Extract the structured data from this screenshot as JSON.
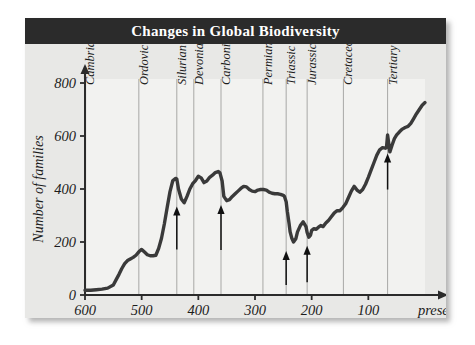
{
  "figure": {
    "title": "Changes in Global Biodiversity",
    "title_bar_color": "#2b2b2b",
    "title_text_color": "#ffffff",
    "background_color": "#e8e8e6",
    "plot_background_color": "#f2f2f0",
    "curve_color": "#3a3a3a",
    "gridline_color": "#a8a8a6"
  },
  "chart_data": {
    "type": "line",
    "title": "Changes in Global Biodiversity",
    "xlabel": "Time (in millions of years ago)",
    "ylabel": "Number of families",
    "xlim": [
      600,
      0
    ],
    "ylim": [
      0,
      800
    ],
    "x_axis_reversed": true,
    "grid": false,
    "legend": null,
    "xticks": [
      600,
      500,
      400,
      300,
      200,
      100,
      0
    ],
    "xtick_labels": [
      "600",
      "500",
      "400",
      "300",
      "200",
      "100",
      "present"
    ],
    "yticks": [
      0,
      200,
      400,
      600,
      800
    ],
    "ytick_labels": [
      "0",
      "200",
      "400",
      "600",
      "800"
    ],
    "series": [
      {
        "name": "Number of marine families",
        "x": [
          600,
          590,
          580,
          570,
          560,
          550,
          545,
          540,
          535,
          530,
          525,
          520,
          515,
          510,
          505,
          500,
          495,
          490,
          485,
          480,
          475,
          470,
          465,
          460,
          455,
          450,
          445,
          440,
          438,
          435,
          430,
          425,
          420,
          415,
          410,
          405,
          400,
          395,
          390,
          385,
          380,
          375,
          370,
          365,
          362,
          358,
          355,
          350,
          345,
          340,
          335,
          330,
          325,
          320,
          315,
          310,
          305,
          300,
          295,
          290,
          285,
          280,
          275,
          270,
          265,
          260,
          255,
          250,
          248,
          245,
          243,
          240,
          238,
          235,
          232,
          228,
          225,
          220,
          215,
          210,
          208,
          205,
          202,
          200,
          196,
          192,
          188,
          184,
          180,
          175,
          170,
          165,
          160,
          155,
          150,
          145,
          140,
          135,
          130,
          125,
          120,
          115,
          110,
          105,
          100,
          95,
          90,
          85,
          80,
          75,
          70,
          68,
          66,
          64,
          62,
          58,
          54,
          50,
          45,
          40,
          35,
          30,
          25,
          20,
          15,
          10,
          5,
          0
        ],
        "y": [
          18,
          18,
          20,
          22,
          26,
          38,
          58,
          78,
          100,
          118,
          130,
          136,
          142,
          150,
          163,
          172,
          162,
          152,
          148,
          148,
          150,
          176,
          214,
          268,
          330,
          390,
          432,
          440,
          438,
          400,
          362,
          348,
          372,
          400,
          420,
          432,
          448,
          442,
          424,
          430,
          444,
          452,
          462,
          466,
          462,
          430,
          372,
          356,
          360,
          372,
          382,
          392,
          402,
          410,
          408,
          398,
          392,
          390,
          396,
          398,
          398,
          396,
          388,
          384,
          382,
          382,
          380,
          376,
          372,
          352,
          316,
          272,
          238,
          214,
          200,
          212,
          238,
          262,
          276,
          258,
          236,
          218,
          226,
          244,
          250,
          248,
          256,
          262,
          258,
          272,
          282,
          296,
          310,
          318,
          318,
          330,
          344,
          368,
          392,
          410,
          396,
          388,
          398,
          418,
          444,
          472,
          500,
          528,
          548,
          556,
          554,
          556,
          604,
          572,
          540,
          566,
          590,
          604,
          616,
          626,
          632,
          636,
          648,
          666,
          684,
          700,
          716,
          726
        ]
      }
    ],
    "geologic_periods": [
      {
        "name": "Cambrian",
        "start": 600,
        "end": 505
      },
      {
        "name": "Ordovician",
        "start": 505,
        "end": 438
      },
      {
        "name": "Silurian",
        "start": 438,
        "end": 408
      },
      {
        "name": "Devonian",
        "start": 408,
        "end": 360
      },
      {
        "name": "Carboniferous",
        "start": 360,
        "end": 286
      },
      {
        "name": "Permian",
        "start": 286,
        "end": 245
      },
      {
        "name": "Triassic",
        "start": 245,
        "end": 208
      },
      {
        "name": "Jurassic",
        "start": 208,
        "end": 144
      },
      {
        "name": "Cretaceous",
        "start": 144,
        "end": 66
      },
      {
        "name": "Tertiary",
        "start": 66,
        "end": 0
      }
    ],
    "annotations": [
      {
        "label": "mass-extinction-marker",
        "x": 438,
        "y_top": 330,
        "y_bottom": 172
      },
      {
        "label": "mass-extinction-marker",
        "x": 360,
        "y_top": 336,
        "y_bottom": 170
      },
      {
        "label": "mass-extinction-marker",
        "x": 245,
        "y_top": 162,
        "y_bottom": 38
      },
      {
        "label": "mass-extinction-marker",
        "x": 208,
        "y_top": 182,
        "y_bottom": 48
      },
      {
        "label": "mass-extinction-marker",
        "x": 66,
        "y_top": 530,
        "y_bottom": 398
      }
    ]
  }
}
